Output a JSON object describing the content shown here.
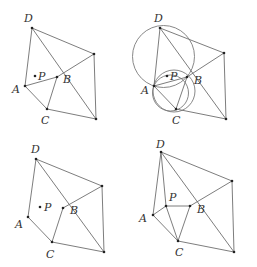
{
  "figures": [
    {
      "id": "panel-1",
      "points": {
        "D": [
          32,
          28
        ],
        "E": [
          94,
          54
        ],
        "B": [
          57,
          77
        ],
        "A": [
          25,
          86
        ],
        "C": [
          47,
          109
        ],
        "F": [
          96,
          119
        ],
        "P": [
          35,
          76
        ]
      },
      "segments": [
        [
          "D",
          "A"
        ],
        [
          "D",
          "F"
        ],
        [
          "D",
          "E"
        ],
        [
          "A",
          "B"
        ],
        [
          "B",
          "E"
        ],
        [
          "A",
          "C"
        ],
        [
          "B",
          "C"
        ],
        [
          "C",
          "F"
        ],
        [
          "E",
          "F"
        ]
      ],
      "labels": [
        {
          "text": "D",
          "x": 24,
          "y": 22
        },
        {
          "text": "A",
          "x": 12,
          "y": 93
        },
        {
          "text": "C",
          "x": 41,
          "y": 124
        },
        {
          "text": "B",
          "x": 63,
          "y": 83
        },
        {
          "text": "P",
          "x": 38,
          "y": 80
        }
      ],
      "circles": []
    },
    {
      "id": "panel-2",
      "points": {
        "D": [
          160,
          28
        ],
        "E": [
          224,
          53
        ],
        "B": [
          187,
          77
        ],
        "A": [
          154,
          86
        ],
        "C": [
          176,
          109
        ],
        "F": [
          226,
          119
        ],
        "P": [
          167,
          76
        ]
      },
      "segments": [
        [
          "D",
          "A"
        ],
        [
          "D",
          "F"
        ],
        [
          "D",
          "E"
        ],
        [
          "A",
          "B"
        ],
        [
          "B",
          "E"
        ],
        [
          "A",
          "C"
        ],
        [
          "B",
          "C"
        ],
        [
          "C",
          "F"
        ],
        [
          "E",
          "F"
        ]
      ],
      "labels": [
        {
          "text": "D",
          "x": 154,
          "y": 22
        },
        {
          "text": "A",
          "x": 141,
          "y": 94
        },
        {
          "text": "C",
          "x": 172,
          "y": 124
        },
        {
          "text": "B",
          "x": 194,
          "y": 84
        },
        {
          "text": "P",
          "x": 170,
          "y": 80
        }
      ],
      "circles": [
        {
          "cx": 163.5,
          "cy": 56.5,
          "r": 31
        },
        {
          "cx": 174,
          "cy": 91,
          "r": 21
        },
        {
          "cx": 170.5,
          "cy": 93,
          "r": 18
        }
      ]
    },
    {
      "id": "panel-3",
      "points": {
        "D": [
          36,
          159
        ],
        "E": [
          102,
          186
        ],
        "B": [
          63,
          208
        ],
        "A": [
          28,
          217
        ],
        "C": [
          52,
          242
        ],
        "F": [
          104,
          252
        ],
        "P": [
          40,
          207
        ]
      },
      "segments": [
        [
          "D",
          "A"
        ],
        [
          "D",
          "F"
        ],
        [
          "D",
          "E"
        ],
        [
          "B",
          "E"
        ],
        [
          "A",
          "C"
        ],
        [
          "B",
          "C"
        ],
        [
          "C",
          "F"
        ],
        [
          "E",
          "F"
        ]
      ],
      "labels": [
        {
          "text": "D",
          "x": 31,
          "y": 153
        },
        {
          "text": "A",
          "x": 15,
          "y": 228
        },
        {
          "text": "C",
          "x": 46,
          "y": 258
        },
        {
          "text": "B",
          "x": 70,
          "y": 214
        },
        {
          "text": "P",
          "x": 44,
          "y": 211
        }
      ],
      "circles": []
    },
    {
      "id": "panel-4",
      "points": {
        "D": [
          161,
          152
        ],
        "E": [
          232,
          181
        ],
        "B": [
          190,
          206
        ],
        "A": [
          153,
          215
        ],
        "C": [
          178,
          241
        ],
        "F": [
          234,
          252
        ],
        "P": [
          166,
          206
        ]
      },
      "segments": [
        [
          "D",
          "A"
        ],
        [
          "D",
          "P"
        ],
        [
          "D",
          "F"
        ],
        [
          "D",
          "E"
        ],
        [
          "A",
          "P"
        ],
        [
          "A",
          "C"
        ],
        [
          "P",
          "B"
        ],
        [
          "P",
          "C"
        ],
        [
          "B",
          "C"
        ],
        [
          "B",
          "E"
        ],
        [
          "C",
          "F"
        ],
        [
          "E",
          "F"
        ]
      ],
      "labels": [
        {
          "text": "D",
          "x": 156,
          "y": 148
        },
        {
          "text": "A",
          "x": 139,
          "y": 222
        },
        {
          "text": "C",
          "x": 175,
          "y": 256
        },
        {
          "text": "B",
          "x": 197,
          "y": 213
        },
        {
          "text": "P",
          "x": 169,
          "y": 201
        }
      ],
      "circles": []
    }
  ]
}
